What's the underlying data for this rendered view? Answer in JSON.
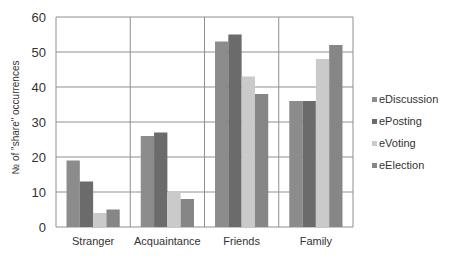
{
  "chart_data": {
    "type": "bar",
    "title": "",
    "xlabel": "",
    "ylabel": "№ of \"share\" occurrences",
    "ylim": [
      0,
      60
    ],
    "yticks": [
      0,
      10,
      20,
      30,
      40,
      50,
      60
    ],
    "grid": true,
    "legend_position": "right",
    "categories": [
      "Stranger",
      "Acquaintance",
      "Friends",
      "Family"
    ],
    "series": [
      {
        "name": "eDiscussion",
        "color": "#8c8c8c",
        "values": [
          19,
          26,
          53,
          36
        ]
      },
      {
        "name": "ePosting",
        "color": "#6b6b6b",
        "values": [
          13,
          27,
          55,
          36
        ]
      },
      {
        "name": "eVoting",
        "color": "#cacaca",
        "values": [
          4,
          10,
          43,
          48
        ]
      },
      {
        "name": "eElection",
        "color": "#868686",
        "values": [
          5,
          8,
          38,
          52
        ]
      }
    ]
  }
}
